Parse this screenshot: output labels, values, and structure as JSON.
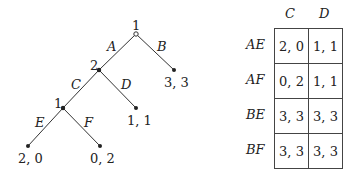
{
  "tree": {
    "nodes": [
      {
        "id": "root",
        "player": "1",
        "x": 136,
        "y": 34,
        "hollow": true
      },
      {
        "id": "n2",
        "player": "2",
        "x": 99,
        "y": 70
      },
      {
        "id": "n1",
        "player": "1",
        "x": 63,
        "y": 108
      }
    ],
    "edges": [
      {
        "label": "A",
        "from": "root",
        "to": "n2"
      },
      {
        "label": "B",
        "from": "root",
        "to": "leaf_B"
      },
      {
        "label": "C",
        "from": "n2",
        "to": "n1"
      },
      {
        "label": "D",
        "from": "n2",
        "to": "leaf_D"
      },
      {
        "label": "E",
        "from": "n1",
        "to": "leaf_E"
      },
      {
        "label": "F",
        "from": "n1",
        "to": "leaf_F"
      }
    ],
    "leaves": [
      {
        "id": "leaf_B",
        "payoff": "3, 3"
      },
      {
        "id": "leaf_D",
        "payoff": "1, 1"
      },
      {
        "id": "leaf_E",
        "payoff": "2, 0"
      },
      {
        "id": "leaf_F",
        "payoff": "0, 2"
      }
    ]
  },
  "matrix": {
    "columns": [
      "C",
      "D"
    ],
    "rows": [
      {
        "label": "AE",
        "cells": [
          "2, 0",
          "1, 1"
        ]
      },
      {
        "label": "AF",
        "cells": [
          "0, 2",
          "1, 1"
        ]
      },
      {
        "label": "BE",
        "cells": [
          "3, 3",
          "3, 3"
        ]
      },
      {
        "label": "BF",
        "cells": [
          "3, 3",
          "3, 3"
        ]
      }
    ]
  }
}
